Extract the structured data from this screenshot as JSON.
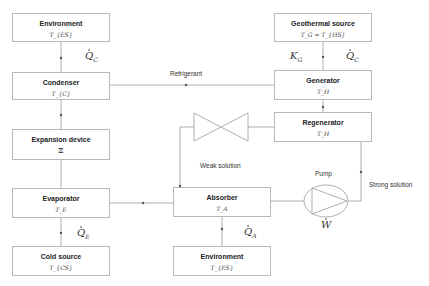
{
  "diagram": {
    "type": "absorption-refrigeration-schematic",
    "boxes": {
      "environment_top": {
        "title": "Environment",
        "sub": "T_{ES}"
      },
      "condenser": {
        "title": "Condenser",
        "sub": "T_{C}"
      },
      "expansion_device": {
        "title": "Expansion device",
        "sub": "⧖"
      },
      "evaporator": {
        "title": "Evaporator",
        "sub": "T_E"
      },
      "cold_source": {
        "title": "Cold source",
        "sub": "T_{CS}"
      },
      "geothermal_source": {
        "title": "Geothermal source",
        "sub": "T_G = T_{HS}"
      },
      "generator": {
        "title": "Generator",
        "sub": "T_H"
      },
      "regenerator": {
        "title": "Regenerator",
        "sub": "T_H"
      },
      "absorber": {
        "title": "Absorber",
        "sub": "T_A"
      },
      "environment_bottom": {
        "title": "Environment",
        "sub": "T_{ES}"
      }
    },
    "labels": {
      "refrigerant": "Refrigerant",
      "weak_solution": "Weak solution",
      "strong_solution": "Strong solution",
      "pump": "Pump"
    },
    "symbols": {
      "q_c_left": {
        "base": "Q",
        "sub": "C"
      },
      "q_c_right": {
        "base": "Q",
        "sub": "C"
      },
      "k_g": {
        "base": "K",
        "sub": "G"
      },
      "q_e": {
        "base": "Q",
        "sub": "E"
      },
      "q_a": {
        "base": "Q",
        "sub": "A"
      },
      "w": {
        "base": "W",
        "sub": ""
      }
    },
    "colors": {
      "line": "#9a9a9a",
      "border": "#b8b8b8",
      "text": "#222222"
    }
  }
}
